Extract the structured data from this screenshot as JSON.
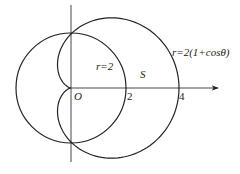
{
  "diagram": {
    "curves": [
      {
        "name": "circle",
        "equation_label": "r=2",
        "radius": 2
      },
      {
        "name": "cardioid",
        "equation_label": "r=2(1+cosθ)"
      }
    ],
    "region_label": "S",
    "origin_label": "O",
    "tick_labels": [
      "2",
      "4"
    ],
    "stroke_color": "#222222"
  }
}
